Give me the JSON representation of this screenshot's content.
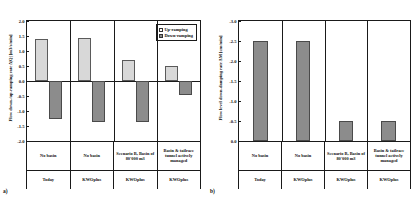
{
  "figure": {
    "panel_a_label": "a)",
    "panel_b_label": "b)"
  },
  "colors": {
    "up_ramping_fill": "#d8d8d8",
    "down_ramping_fill": "#8c8c8c",
    "axis": "#1a1a1a",
    "background": "#ffffff"
  },
  "categories": [
    {
      "scenario": "No basin",
      "mode": "Today"
    },
    {
      "scenario": "No basin",
      "mode": "KWOplus"
    },
    {
      "scenario": "Scenario B, Basin of 80'000 m3",
      "mode": "KWOplus"
    },
    {
      "scenario": "Basin & tailrace tunnel actively managed",
      "mode": "KWOplus"
    }
  ],
  "chart_data": [
    {
      "type": "bar",
      "panel": "a",
      "title": "",
      "xlabel": "",
      "ylabel": "Flow down-/up-ramping rate Δ|Q| [m3/s/min]",
      "ylim": [
        -2.0,
        2.0
      ],
      "yticks": [
        2.0,
        1.5,
        1.0,
        0.5,
        0.0,
        -0.5,
        -1.0,
        -1.5,
        -2.0
      ],
      "ytick_labels": [
        "2.0",
        "1.5",
        "1.0",
        "0.5",
        "0.0",
        "-0.5",
        "-1.0",
        "-1.5",
        "-2.0"
      ],
      "grid": false,
      "legend_position": "top-right",
      "categories": [
        "No basin / Today",
        "No basin / KWOplus",
        "Scenario B, Basin of 80'000 m3 / KWOplus",
        "Basin & tailrace tunnel actively managed / KWOplus"
      ],
      "series": [
        {
          "name": "Up-ramping",
          "values": [
            1.4,
            1.45,
            0.7,
            0.5
          ],
          "color": "#d8d8d8"
        },
        {
          "name": "Down-ramping",
          "values": [
            -1.25,
            -1.35,
            -1.35,
            -0.45
          ],
          "color": "#8c8c8c"
        }
      ]
    },
    {
      "type": "bar",
      "panel": "b",
      "title": "",
      "xlabel": "",
      "ylabel": "Flow level down-damping rate ΔM [cm/min]",
      "ylim": [
        -3.0,
        0.0
      ],
      "y_axis_inverted": true,
      "yticks": [
        -3.0,
        -2.5,
        -2.0,
        -1.5,
        -1.0,
        -0.5,
        0.0
      ],
      "ytick_labels": [
        "-3.0",
        "-2.5",
        "-2.0",
        "-1.5",
        "-1.0",
        "-0.5",
        "0.0"
      ],
      "grid": false,
      "legend_position": "none",
      "categories": [
        "No basin / Today",
        "No basin / KWOplus",
        "Scenario B, Basin of 80'000 m3 / KWOplus",
        "Basin & tailrace tunnel actively managed / KWOplus"
      ],
      "series": [
        {
          "name": "Down-damping",
          "values": [
            -2.5,
            -2.5,
            -0.5,
            -0.5
          ],
          "color": "#8c8c8c"
        }
      ]
    }
  ],
  "legend": {
    "items": [
      {
        "label": "Up-ramping",
        "swatch": "light"
      },
      {
        "label": "Down-ramping",
        "swatch": "dark"
      }
    ]
  }
}
